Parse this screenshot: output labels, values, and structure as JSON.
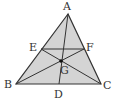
{
  "diagram": {
    "type": "geometry-triangle",
    "fill_color": "#d4d4d4",
    "line_color": "#333333",
    "points": {
      "A": {
        "label": "A",
        "x": 68,
        "y": 14
      },
      "B": {
        "label": "B",
        "x": 16,
        "y": 84
      },
      "C": {
        "label": "C",
        "x": 101,
        "y": 84
      },
      "D": {
        "label": "D",
        "x": 59,
        "y": 84
      },
      "E": {
        "label": "E",
        "x": 41,
        "y": 49
      },
      "F": {
        "label": "F",
        "x": 84,
        "y": 49
      },
      "G": {
        "label": "G",
        "x": 61,
        "y": 61
      }
    },
    "segments": [
      "AB",
      "BC",
      "CA",
      "EF",
      "AD",
      "BF",
      "CE"
    ]
  }
}
